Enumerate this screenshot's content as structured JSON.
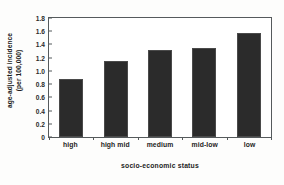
{
  "chart_data": {
    "type": "bar",
    "title": "",
    "categories": [
      "high",
      "high mid",
      "medium",
      "mid-low",
      "low"
    ],
    "values": [
      0.87,
      1.15,
      1.32,
      1.34,
      1.58
    ],
    "xlabel": "socio-economic status",
    "ylabel_line1": "age-adjusted incidence",
    "ylabel_line2": "(per 100,000)",
    "ylim": [
      0,
      1.8
    ],
    "yticks": [
      "0",
      "0.2",
      "0.4",
      "0.6",
      "0.8",
      "1.0",
      "1.2",
      "1.4",
      "1.6",
      "1.8"
    ],
    "ytick_values": [
      0,
      0.2,
      0.4,
      0.6,
      0.8,
      1.0,
      1.2,
      1.4,
      1.6,
      1.8
    ],
    "grid": false,
    "legend": "none",
    "bar_color": "#2b2b2b",
    "frame_color": "#555a5c",
    "background_color": "#ffffff"
  }
}
